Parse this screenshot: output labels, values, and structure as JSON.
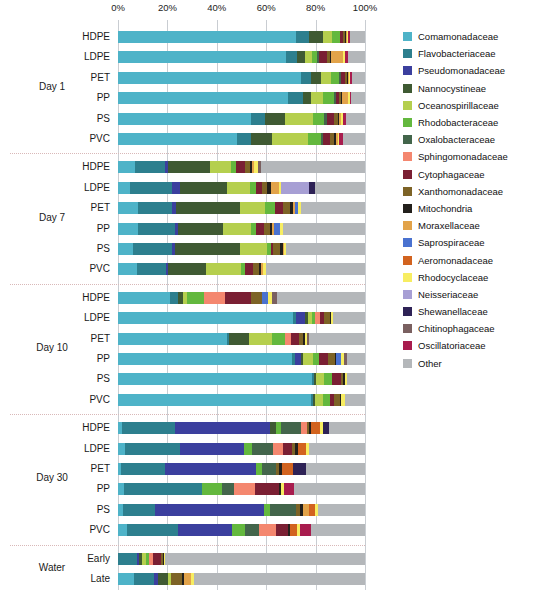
{
  "chart_data": {
    "type": "bar",
    "subtype": "stacked-horizontal-100pct",
    "title": "",
    "xlabel": "",
    "ylabel": "",
    "xlim": [
      0,
      100
    ],
    "grid": true,
    "legend_position": "right",
    "x_ticks": [
      "0%",
      "20%",
      "40%",
      "60%",
      "80%",
      "100%"
    ],
    "x_tick_values": [
      0,
      20,
      40,
      60,
      80,
      100
    ],
    "taxa": [
      "Comamonadaceae",
      "Flavobacteriaceae",
      "Pseudomonadaceae",
      "Nannocystineae",
      "Oceanospirillaceae",
      "Rhodobacteraceae",
      "Oxalobacteraceae",
      "Sphingomonadaceae",
      "Cytophagaceae",
      "Xanthomonadaceae",
      "Mitochondria",
      "Moraxellaceae",
      "Saprospiraceae",
      "Aeromonadaceae",
      "Rhodocyclaceae",
      "Neisseriaceae",
      "Shewanellaceae",
      "Chitinophagaceae",
      "Oscillatoriaceae",
      "Other"
    ],
    "colors": [
      "#4eb3c8",
      "#2d7f8e",
      "#3b3f9e",
      "#3f5a33",
      "#b5cf4e",
      "#63b83e",
      "#43654b",
      "#f4876f",
      "#7a1f33",
      "#7d6326",
      "#23201c",
      "#e2a34a",
      "#4a72d0",
      "#d2631f",
      "#f7ed62",
      "#a79fd4",
      "#2e2256",
      "#7a6060",
      "#a81c4e",
      "#b4b7ba"
    ],
    "groups": [
      {
        "name": "Day 1",
        "rows": [
          {
            "label": "HDPE",
            "values": [
              72.0,
              5.5,
              0.0,
              5.5,
              3.8,
              3.0,
              0.0,
              0.0,
              1.5,
              0.6,
              0.4,
              0.4,
              0.0,
              0.0,
              0.4,
              0.0,
              0.0,
              0.0,
              0.9,
              6.0
            ]
          },
          {
            "label": "LDPE",
            "values": [
              68.0,
              4.5,
              0.0,
              3.2,
              2.8,
              2.2,
              0.8,
              0.0,
              3.2,
              1.0,
              0.5,
              5.0,
              0.0,
              0.0,
              0.6,
              0.0,
              0.0,
              0.0,
              1.2,
              7.0
            ]
          },
          {
            "label": "PET",
            "values": [
              74.0,
              4.0,
              0.0,
              4.0,
              4.4,
              3.2,
              0.7,
              0.0,
              1.6,
              0.7,
              0.4,
              0.4,
              0.0,
              0.0,
              0.5,
              0.0,
              0.0,
              0.0,
              0.8,
              5.3
            ]
          },
          {
            "label": "PP",
            "values": [
              69.0,
              6.0,
              0.0,
              3.2,
              5.0,
              4.2,
              0.7,
              0.0,
              1.4,
              0.8,
              0.5,
              2.4,
              0.0,
              0.0,
              0.6,
              0.0,
              0.0,
              0.0,
              0.7,
              5.5
            ]
          },
          {
            "label": "PS",
            "values": [
              54.0,
              5.5,
              0.0,
              8.0,
              11.5,
              4.5,
              1.2,
              0.0,
              2.8,
              1.5,
              0.7,
              0.7,
              0.0,
              0.0,
              0.8,
              0.0,
              0.0,
              0.0,
              1.3,
              7.5
            ]
          },
          {
            "label": "PVC",
            "values": [
              48.0,
              6.0,
              0.0,
              8.5,
              14.5,
              5.0,
              1.0,
              0.0,
              3.0,
              1.4,
              0.8,
              0.8,
              0.0,
              0.0,
              0.7,
              0.0,
              0.0,
              0.0,
              1.3,
              9.0
            ]
          }
        ]
      },
      {
        "name": "Day 7",
        "rows": [
          {
            "label": "HDPE",
            "values": [
              7.0,
              12.0,
              1.2,
              17.0,
              8.5,
              2.2,
              0.0,
              0.0,
              3.6,
              2.0,
              0.8,
              0.7,
              0.0,
              0.0,
              1.6,
              0.0,
              0.0,
              1.4,
              0.0,
              42.0
            ]
          },
          {
            "label": "LDPE",
            "values": [
              5.0,
              17.0,
              3.0,
              19.0,
              9.5,
              2.4,
              0.0,
              0.0,
              2.4,
              2.2,
              1.6,
              3.2,
              0.0,
              0.0,
              0.6,
              11.5,
              2.6,
              0.0,
              0.0,
              20.0
            ]
          },
          {
            "label": "PET",
            "values": [
              8.0,
              14.0,
              1.6,
              26.0,
              10.0,
              4.0,
              0.0,
              0.0,
              3.2,
              2.8,
              1.2,
              0.8,
              1.4,
              0.0,
              1.0,
              0.0,
              0.0,
              0.0,
              0.0,
              26.0
            ]
          },
          {
            "label": "PP",
            "values": [
              8.0,
              15.0,
              1.4,
              18.0,
              11.5,
              1.8,
              0.0,
              0.0,
              3.6,
              2.2,
              1.0,
              0.8,
              2.2,
              0.0,
              1.4,
              0.0,
              0.0,
              0.0,
              0.0,
              33.1
            ]
          },
          {
            "label": "PS",
            "values": [
              6.0,
              16.0,
              0.9,
              26.5,
              11.0,
              1.5,
              0.0,
              0.0,
              0.9,
              3.0,
              0.9,
              0.7,
              0.0,
              0.0,
              0.6,
              0.0,
              0.0,
              0.0,
              0.0,
              32.0
            ]
          },
          {
            "label": "PVC",
            "values": [
              7.5,
              12.0,
              0.8,
              15.5,
              14.0,
              1.6,
              0.0,
              0.0,
              3.2,
              2.4,
              0.8,
              0.8,
              0.0,
              0.0,
              1.2,
              0.0,
              0.0,
              0.0,
              0.0,
              40.2
            ]
          }
        ]
      },
      {
        "name": "Day 10",
        "rows": [
          {
            "label": "HDPE",
            "values": [
              21.0,
              3.2,
              0.0,
              2.2,
              1.6,
              7.0,
              0.0,
              8.5,
              10.5,
              4.5,
              0.0,
              0.0,
              2.4,
              0.0,
              1.4,
              0.0,
              0.0,
              2.2,
              0.0,
              35.5
            ]
          },
          {
            "label": "LDPE",
            "values": [
              71.0,
              1.2,
              3.5,
              1.4,
              1.4,
              1.4,
              0.0,
              1.8,
              1.8,
              2.2,
              0.5,
              0.0,
              0.0,
              0.0,
              1.0,
              0.0,
              0.0,
              0.0,
              0.0,
              12.8
            ]
          },
          {
            "label": "PET",
            "values": [
              44.0,
              1.0,
              0.0,
              8.0,
              9.5,
              5.0,
              0.0,
              2.6,
              3.0,
              2.0,
              0.6,
              0.0,
              0.0,
              0.0,
              0.8,
              0.0,
              0.0,
              1.0,
              0.0,
              22.5
            ]
          },
          {
            "label": "PP",
            "values": [
              70.5,
              1.0,
              2.4,
              1.0,
              4.0,
              2.6,
              0.0,
              0.0,
              3.6,
              2.6,
              0.6,
              0.0,
              1.8,
              0.0,
              1.4,
              0.0,
              0.0,
              1.4,
              0.0,
              7.1
            ]
          },
          {
            "label": "PS",
            "values": [
              78.5,
              0.8,
              0.0,
              0.8,
              3.2,
              3.2,
              0.0,
              0.0,
              3.6,
              1.2,
              0.5,
              0.0,
              0.0,
              0.0,
              1.0,
              0.0,
              0.0,
              0.0,
              0.0,
              7.2
            ]
          },
          {
            "label": "PVC",
            "values": [
              78.0,
              0.8,
              0.0,
              0.8,
              3.6,
              2.8,
              0.0,
              0.0,
              1.6,
              2.2,
              0.5,
              0.0,
              0.0,
              0.0,
              1.8,
              0.0,
              0.0,
              0.0,
              0.0,
              7.9
            ]
          }
        ]
      },
      {
        "name": "Day 30",
        "rows": [
          {
            "label": "HDPE",
            "values": [
              1.6,
              21.5,
              38.5,
              2.2,
              0.0,
              2.4,
              8.0,
              2.4,
              0.0,
              0.8,
              0.8,
              0.0,
              0.0,
              3.6,
              1.4,
              0.0,
              2.4,
              0.0,
              0.0,
              14.4
            ]
          },
          {
            "label": "LDPE",
            "values": [
              3.0,
              22.0,
              26.0,
              0.0,
              0.0,
              3.2,
              8.5,
              4.2,
              3.6,
              1.2,
              1.4,
              0.0,
              0.0,
              3.0,
              1.4,
              0.0,
              0.0,
              0.0,
              0.0,
              22.5
            ]
          },
          {
            "label": "PET",
            "values": [
              1.4,
              17.5,
              37.0,
              0.0,
              0.0,
              2.4,
              5.5,
              0.0,
              0.0,
              1.2,
              1.6,
              0.0,
              0.0,
              4.2,
              0.0,
              0.0,
              5.5,
              0.0,
              0.0,
              23.7
            ]
          },
          {
            "label": "PP",
            "values": [
              2.6,
              31.5,
              0.0,
              0.0,
              0.0,
              8.0,
              5.0,
              8.5,
              9.5,
              0.0,
              0.8,
              0.0,
              0.0,
              0.0,
              1.4,
              0.0,
              0.0,
              0.0,
              4.0,
              28.7
            ]
          },
          {
            "label": "PS",
            "values": [
              2.0,
              13.0,
              44.0,
              0.0,
              0.0,
              2.6,
              10.5,
              0.0,
              0.0,
              1.4,
              1.4,
              2.4,
              0.0,
              2.4,
              1.4,
              0.0,
              0.0,
              0.0,
              0.0,
              18.9
            ]
          },
          {
            "label": "PVC",
            "values": [
              3.6,
              20.5,
              22.0,
              0.0,
              0.0,
              5.5,
              5.5,
              7.0,
              4.6,
              0.0,
              1.0,
              0.0,
              0.0,
              2.6,
              1.6,
              0.0,
              0.0,
              0.0,
              4.2,
              21.9
            ]
          }
        ]
      },
      {
        "name": "Water",
        "rows": [
          {
            "label": "Early",
            "values": [
              0.0,
              7.5,
              1.0,
              1.4,
              1.6,
              1.2,
              0.0,
              1.6,
              3.0,
              0.8,
              0.5,
              0.0,
              0.0,
              0.0,
              0.6,
              0.0,
              0.0,
              0.0,
              0.0,
              80.8
            ]
          },
          {
            "label": "Late",
            "values": [
              6.5,
              8.0,
              1.6,
              4.2,
              1.2,
              0.0,
              0.0,
              0.0,
              0.0,
              4.5,
              0.8,
              2.6,
              0.0,
              0.0,
              1.2,
              0.0,
              0.0,
              0.0,
              0.0,
              69.4
            ]
          }
        ]
      }
    ]
  }
}
